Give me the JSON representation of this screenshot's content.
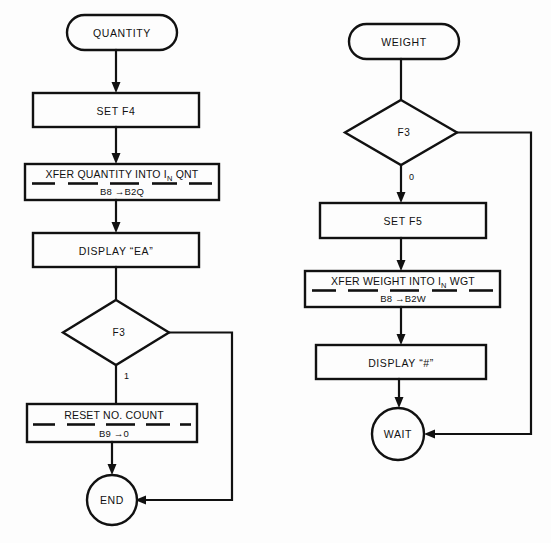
{
  "diagram": {
    "background_color": "#fdfdfd",
    "line_color": "#111111"
  },
  "flow_quantity": {
    "start": {
      "label": "QUANTITY",
      "shape": "terminal"
    },
    "set_flag": {
      "label": "SET F4",
      "shape": "process"
    },
    "xfer": {
      "shape": "process-divided",
      "line1_prefix": "XFER QUANTITY INTO I",
      "line1_subscript": "N",
      "line1_suffix": " QNT",
      "line2": "B8 →B2Q"
    },
    "display": {
      "label": "DISPLAY “EA”",
      "shape": "process"
    },
    "decision": {
      "label": "F3",
      "shape": "decision"
    },
    "decision_branch_label": "1",
    "reset": {
      "shape": "process-divided",
      "line1": "RESET NO. COUNT",
      "line2": "B9 →0"
    },
    "end": {
      "label": "END",
      "shape": "connector"
    }
  },
  "flow_weight": {
    "start": {
      "label": "WEIGHT",
      "shape": "terminal"
    },
    "decision": {
      "label": "F3",
      "shape": "decision"
    },
    "decision_branch_label": "0",
    "set_flag": {
      "label": "SET F5",
      "shape": "process"
    },
    "xfer": {
      "shape": "process-divided",
      "line1_prefix": "XFER WEIGHT INTO I",
      "line1_subscript": "N",
      "line1_suffix": " WGT",
      "line2": "B8 →B2W"
    },
    "display": {
      "label": "DISPLAY “#”",
      "shape": "process"
    },
    "end": {
      "label": "WAIT",
      "shape": "connector"
    }
  }
}
